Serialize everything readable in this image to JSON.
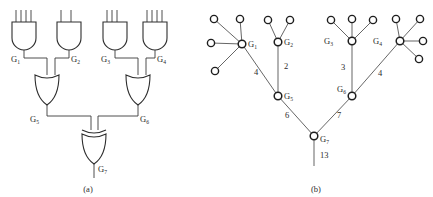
{
  "figure": {
    "panels": [
      {
        "id": "panel-a",
        "caption": "(a)",
        "type": "logic-circuit",
        "gates": [
          {
            "name": "G",
            "index": "1",
            "type": "AND",
            "inputs": 4,
            "label": "G1"
          },
          {
            "name": "G",
            "index": "2",
            "type": "AND",
            "inputs": 2,
            "label": "G2"
          },
          {
            "name": "G",
            "index": "3",
            "type": "AND",
            "inputs": 3,
            "label": "G3"
          },
          {
            "name": "G",
            "index": "4",
            "type": "AND",
            "inputs": 4,
            "label": "G4"
          },
          {
            "name": "G",
            "index": "5",
            "type": "OR",
            "inputs": 2,
            "label": "G5"
          },
          {
            "name": "G",
            "index": "6",
            "type": "OR",
            "inputs": 2,
            "label": "G6"
          },
          {
            "name": "G",
            "index": "7",
            "type": "XOR",
            "inputs": 2,
            "label": "G7"
          }
        ]
      },
      {
        "id": "panel-b",
        "caption": "(b)",
        "type": "weighted-tree",
        "nodes": [
          {
            "name": "G",
            "index": "1",
            "label": "G1",
            "leaves": 4
          },
          {
            "name": "G",
            "index": "2",
            "label": "G2",
            "leaves": 2
          },
          {
            "name": "G",
            "index": "3",
            "label": "G3",
            "leaves": 3
          },
          {
            "name": "G",
            "index": "4",
            "label": "G4",
            "leaves": 4
          },
          {
            "name": "G",
            "index": "5",
            "label": "G5",
            "leaves": 0
          },
          {
            "name": "G",
            "index": "6",
            "label": "G6",
            "leaves": 0
          },
          {
            "name": "G",
            "index": "7",
            "label": "G7",
            "leaves": 0
          }
        ],
        "edge_weights": [
          {
            "from": "G1",
            "to": "G5",
            "weight": "4"
          },
          {
            "from": "G2",
            "to": "G5",
            "weight": "2"
          },
          {
            "from": "G3",
            "to": "G6",
            "weight": "3"
          },
          {
            "from": "G4",
            "to": "G6",
            "weight": "4"
          },
          {
            "from": "G5",
            "to": "G7",
            "weight": "6"
          },
          {
            "from": "G6",
            "to": "G7",
            "weight": "7"
          },
          {
            "from": "G7",
            "to": "root",
            "weight": "13"
          }
        ]
      }
    ]
  },
  "labels": {
    "g1": "G",
    "g1s": "1",
    "g2": "G",
    "g2s": "2",
    "g3": "G",
    "g3s": "3",
    "g4": "G",
    "g4s": "4",
    "g5": "G",
    "g5s": "5",
    "g6": "G",
    "g6s": "6",
    "g7": "G",
    "g7s": "7",
    "tg1": "G",
    "tg1s": "1",
    "tg2": "G",
    "tg2s": "2",
    "tg3": "G",
    "tg3s": "3",
    "tg4": "G",
    "tg4s": "4",
    "tg5": "G",
    "tg5s": "5",
    "tg6": "G",
    "tg6s": "6",
    "tg7": "G",
    "tg7s": "7",
    "w_g1_g5": "4",
    "w_g2_g5": "2",
    "w_g3_g6": "3",
    "w_g4_g6": "4",
    "w_g5_g7": "6",
    "w_g6_g7": "7",
    "w_root": "13",
    "caption_a": "(a)",
    "caption_b": "(b)"
  }
}
